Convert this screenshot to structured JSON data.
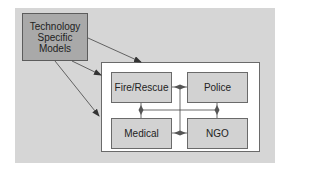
{
  "diagram": {
    "source": {
      "label_lines": [
        "Technology",
        "Specific",
        "Models"
      ]
    },
    "agencies": [
      {
        "id": "fire",
        "label": "Fire/Rescue"
      },
      {
        "id": "police",
        "label": "Police"
      },
      {
        "id": "medical",
        "label": "Medical"
      },
      {
        "id": "ngo",
        "label": "NGO"
      }
    ],
    "edges": [
      {
        "from": "Technology Specific Models",
        "to": "agency-group",
        "type": "arrow"
      },
      {
        "from": "Technology Specific Models",
        "to": "agency-group",
        "type": "arrow"
      },
      {
        "from": "Technology Specific Models",
        "to": "agency-group",
        "type": "arrow"
      },
      {
        "from": "Fire/Rescue",
        "to": "Police",
        "type": "bidirectional"
      },
      {
        "from": "Fire/Rescue",
        "to": "Medical",
        "type": "bidirectional"
      },
      {
        "from": "Police",
        "to": "NGO",
        "type": "bidirectional"
      },
      {
        "from": "Medical",
        "to": "NGO",
        "type": "bidirectional"
      }
    ],
    "colors": {
      "background": "#d6d6d6",
      "source_fill": "#a9a9a9",
      "container_fill": "#ffffff",
      "agency_fill": "#d2d2d2",
      "line": "#444444"
    }
  }
}
